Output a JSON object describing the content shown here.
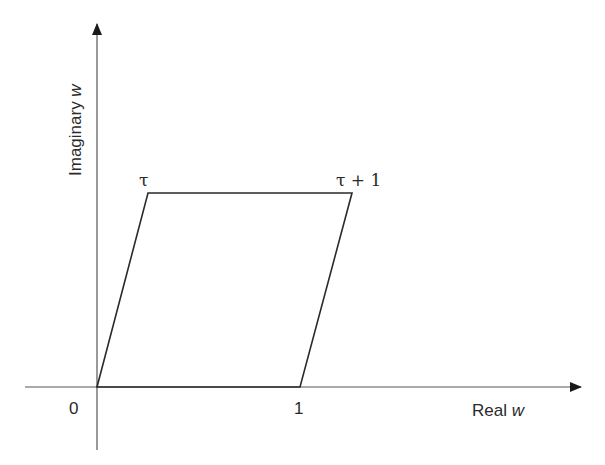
{
  "diagram": {
    "x_axis": {
      "label_text": "Real ",
      "label_var": "w"
    },
    "y_axis": {
      "label_text": "Imaginary ",
      "label_var": "w"
    },
    "vertices": [
      {
        "name": "origin",
        "label": "0"
      },
      {
        "name": "one",
        "label": "1"
      },
      {
        "name": "tau",
        "label": "τ"
      },
      {
        "name": "tau-plus-one",
        "label": "τ + 1"
      }
    ],
    "colors": {
      "stroke": "#2a2a2a",
      "background": "#ffffff"
    }
  }
}
